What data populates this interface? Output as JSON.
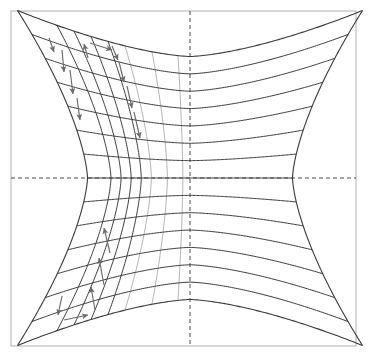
{
  "figure": {
    "width": 370,
    "height": 360,
    "background_color": "#ffffff",
    "caption": ""
  },
  "colors": {
    "frame": "#b0b0b0",
    "axis_dashed": "#4d4d4d",
    "curve_dark": "#3a3a3a",
    "curve_light": "#a8a8a8",
    "arrow": "#6b6b6b"
  },
  "frame": {
    "name": "plot-frame",
    "x": 11,
    "y": 11,
    "width": 345,
    "height": 335,
    "stroke_width": 1
  },
  "axes": {
    "horizontal_dashed": {
      "label": "horizontal-axis",
      "y": 178,
      "x_start": 11,
      "x_end": 356,
      "dash": "4 3"
    },
    "vertical_dashed": {
      "label": "vertical-axis",
      "x": 190,
      "y_start": 11,
      "y_end": 346,
      "dash": "4 3"
    }
  },
  "chart_data": {
    "type": "line",
    "xlabel": "",
    "ylabel": "",
    "xlim": [
      -1,
      1
    ],
    "ylim": [
      -1,
      1
    ],
    "grid": false,
    "legend": "none",
    "boundary_curves": [
      {
        "name": "top-arc",
        "from": [
          11,
          11
        ],
        "to": [
          356,
          11
        ],
        "sag": 178,
        "type": "concave-down-into-region"
      },
      {
        "name": "bottom-arc",
        "from": [
          11,
          346
        ],
        "to": [
          356,
          346
        ],
        "sag": -178,
        "type": "concave-up-into-region"
      },
      {
        "name": "left-arc",
        "from": [
          11,
          11
        ],
        "to": [
          11,
          346
        ],
        "sag": 70,
        "type": "concave-right-into-region"
      },
      {
        "name": "right-arc",
        "from": [
          356,
          11
        ],
        "to": [
          356,
          346
        ],
        "sag": -70,
        "type": "concave-left-into-region"
      }
    ],
    "horizontal_level_curves": {
      "count": 13,
      "center_y_values": [
        57,
        81,
        105,
        128,
        152,
        178,
        202,
        226,
        250,
        274,
        298,
        322
      ],
      "left_x_values": [
        44,
        52,
        60,
        64,
        68,
        70,
        68,
        64,
        60,
        52,
        44,
        33
      ],
      "right_x_values": [
        322,
        314,
        306,
        302,
        298,
        296,
        298,
        302,
        306,
        314,
        322,
        331
      ]
    },
    "vertical_grid_curves": {
      "count": 7,
      "dark_count": 4,
      "light_count": 3,
      "center_x_values": [
        57,
        74,
        91,
        108,
        125,
        152,
        178
      ],
      "shades": [
        "dark",
        "dark",
        "dark",
        "dark",
        "light",
        "light",
        "light"
      ]
    },
    "arrows": [
      {
        "id": 1,
        "group": "upper-left-down",
        "x1": 49,
        "y1": 38,
        "x2": 54,
        "y2": 52,
        "direction": "down"
      },
      {
        "id": 2,
        "group": "upper-left-down",
        "x1": 62,
        "y1": 50,
        "x2": 64,
        "y2": 72,
        "direction": "down"
      },
      {
        "id": 3,
        "group": "upper-left-down",
        "x1": 70,
        "y1": 70,
        "x2": 73,
        "y2": 94,
        "direction": "down"
      },
      {
        "id": 4,
        "group": "upper-left-down",
        "x1": 77,
        "y1": 98,
        "x2": 80,
        "y2": 120,
        "direction": "down"
      },
      {
        "id": 5,
        "group": "upper-left-down",
        "x1": 112,
        "y1": 46,
        "x2": 118,
        "y2": 60,
        "direction": "down"
      },
      {
        "id": 6,
        "group": "upper-left-down",
        "x1": 119,
        "y1": 62,
        "x2": 124,
        "y2": 82,
        "direction": "down"
      },
      {
        "id": 7,
        "group": "upper-left-down",
        "x1": 127,
        "y1": 86,
        "x2": 132,
        "y2": 108,
        "direction": "down"
      },
      {
        "id": 8,
        "group": "upper-left-down",
        "x1": 134,
        "y1": 112,
        "x2": 140,
        "y2": 138,
        "direction": "down"
      },
      {
        "id": 9,
        "group": "upper-left-up",
        "x1": 88,
        "y1": 58,
        "x2": 84,
        "y2": 44,
        "direction": "up"
      },
      {
        "id": 10,
        "group": "top-horizontal",
        "x1": 90,
        "y1": 43,
        "x2": 112,
        "y2": 50,
        "direction": "right"
      },
      {
        "id": 11,
        "group": "lower-left-up",
        "x1": 110,
        "y1": 253,
        "x2": 104,
        "y2": 228,
        "direction": "up"
      },
      {
        "id": 12,
        "group": "lower-left-up",
        "x1": 104,
        "y1": 285,
        "x2": 99,
        "y2": 258,
        "direction": "up"
      },
      {
        "id": 13,
        "group": "lower-left-up",
        "x1": 95,
        "y1": 310,
        "x2": 91,
        "y2": 287,
        "direction": "up"
      },
      {
        "id": 14,
        "group": "lower-left-down",
        "x1": 62,
        "y1": 296,
        "x2": 58,
        "y2": 315,
        "direction": "down"
      },
      {
        "id": 15,
        "group": "bottom-horizontal",
        "x1": 64,
        "y1": 320,
        "x2": 88,
        "y2": 315,
        "direction": "right"
      }
    ]
  }
}
